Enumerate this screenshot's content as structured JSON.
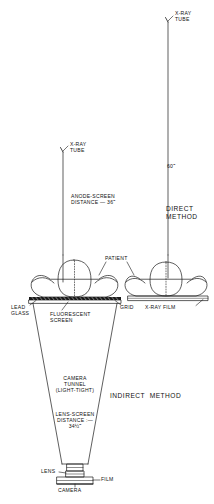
{
  "diagram": {
    "ink_color": "#1a1a1a",
    "background": "#ffffff"
  },
  "labels": {
    "xray_tube_left": "X-RAY\nTUBE",
    "xray_tube_right": "X-RAY\nTUBE",
    "anode_screen_distance": "ANODE-SCREEN\nDISTANCE — 36˝",
    "source_image_distance_right": "60˝",
    "direct_method": "DIRECT\nMETHOD",
    "indirect_method": "INDIRECT  METHOD",
    "patient": "PATIENT",
    "lead_glass": "LEAD\nGLASS",
    "fluorescent_screen": "FLUORESCENT\nSCREEN",
    "grid": "GRID",
    "xray_film": "X-RAY FILM",
    "camera_tunnel": "CAMERA\nTUNNEL\n(LIGHT-TIGHT)",
    "lens_screen_distance": "LENS-SCREEN\nDISTANCE :—\n34½˝",
    "lens": "LENS",
    "film": "FILM",
    "camera": "CAMERA"
  }
}
